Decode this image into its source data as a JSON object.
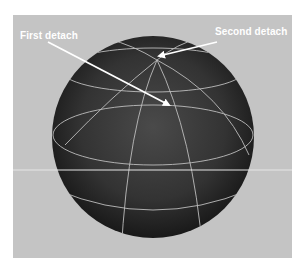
{
  "viewport": {
    "background": "#c4c4c4",
    "object": "nurbs-sphere",
    "sphere_color": "#2e2e2e",
    "isoparm_color": "#bdbdbd",
    "grid_line_color": "#e6e6e6"
  },
  "annotations": [
    {
      "label": "First detach",
      "arrow_color": "#ffffff"
    },
    {
      "label": "Second detach",
      "arrow_color": "#ffffff"
    }
  ]
}
